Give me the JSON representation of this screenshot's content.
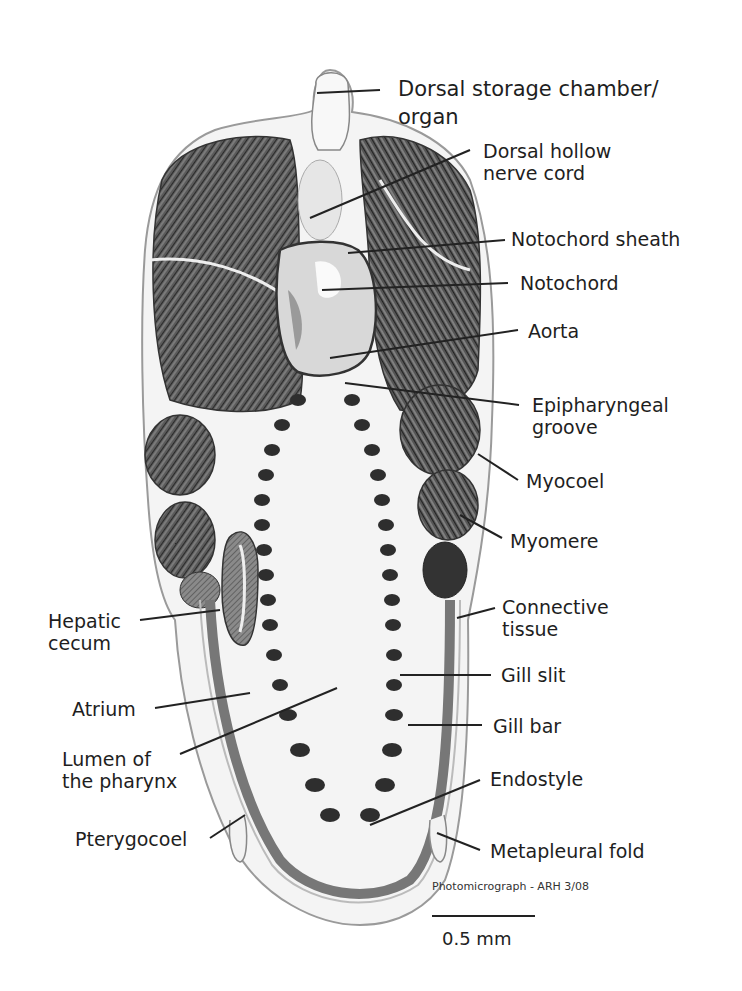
{
  "figure": {
    "labels": {
      "dorsal_storage": "Dorsal storage chamber/\norgan",
      "dorsal_nerve": "Dorsal hollow\nnerve cord",
      "notochord_sheath": "Notochord sheath",
      "notochord": "Notochord",
      "aorta": "Aorta",
      "epipharyngeal": "Epipharyngeal\ngroove",
      "myocoel": "Myocoel",
      "myomere": "Myomere",
      "connective": "Connective\ntissue",
      "gill_slit": "Gill slit",
      "gill_bar": "Gill bar",
      "endostyle": "Endostyle",
      "metapleural": "Metapleural fold",
      "hepatic": "Hepatic\ncecum",
      "atrium": "Atrium",
      "lumen": "Lumen of\nthe pharynx",
      "pterygocoel": "Pterygocoel"
    },
    "credit": "Photomicrograph - ARH 3/08",
    "scale_bar": "0.5 mm"
  }
}
